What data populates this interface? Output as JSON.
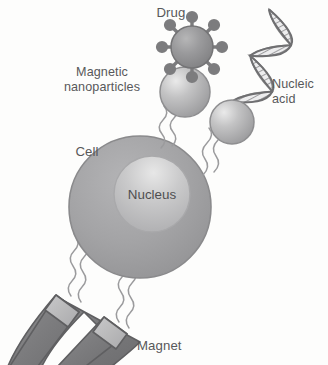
{
  "figure": {
    "kind": "scientific-diagram",
    "background_color": "#fdfdfc",
    "width": 328,
    "height": 365
  },
  "labels": {
    "drug": "Drug",
    "magnetic_nanoparticles_line1": "Magnetic",
    "magnetic_nanoparticles_line2": "nanoparticles",
    "nucleic_acid_line1": "Nucleic",
    "nucleic_acid_line2": "acid",
    "cell": "Cell",
    "nucleus": "Nucleus",
    "magnet": "Magnet"
  },
  "colors": {
    "label_text": "#58585a",
    "nucleus_text": "#4e4e50",
    "cell_fill": "#a3a3a5",
    "cell_stroke": "#8a8a8c",
    "nucleus_fill": "#c2c2c3",
    "nucleus_stroke": "#a9a9ab",
    "nanoparticle_fill": "#b3b3b4",
    "nanoparticle_stroke": "#8e8e90",
    "drug_fill": "#909092",
    "drug_stroke": "#747476",
    "drug_spike": "#7c7c7e",
    "dna_fill": "#d3d3d4",
    "dna_stroke": "#8c8c8e",
    "magnet_body": "#7e7e80",
    "magnet_tip": "#b7b7b8",
    "magnet_stroke": "#5f5f61",
    "tether": "#9b9b9d"
  },
  "elements": {
    "cell": {
      "cx": 140,
      "cy": 207,
      "r": 71
    },
    "nucleus": {
      "cx": 152,
      "cy": 194,
      "r": 38
    },
    "nanoparticle_upper": {
      "cx": 185,
      "cy": 92,
      "r": 24
    },
    "nanoparticle_lower": {
      "cx": 232,
      "cy": 122,
      "r": 22
    },
    "drug_particle": {
      "cx": 192,
      "cy": 47,
      "r": 21,
      "spike_count": 8
    },
    "dna_helix": {
      "x": 238,
      "y": 12,
      "width": 56,
      "height": 100,
      "turns": 3
    },
    "magnet": {
      "shape": "horseshoe",
      "arms": 2,
      "tip_caps": 2
    }
  }
}
